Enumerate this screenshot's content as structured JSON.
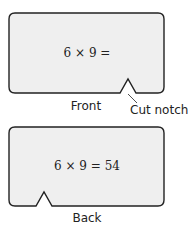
{
  "front_card": {
    "equation": "6 × 9 =",
    "caption": "Front",
    "notch_label": "Cut notch",
    "fill": "#efefef",
    "stroke": "#222222"
  },
  "back_card": {
    "equation": "6 × 9 = 54",
    "caption": "Back",
    "fill": "#efefef",
    "stroke": "#222222"
  }
}
